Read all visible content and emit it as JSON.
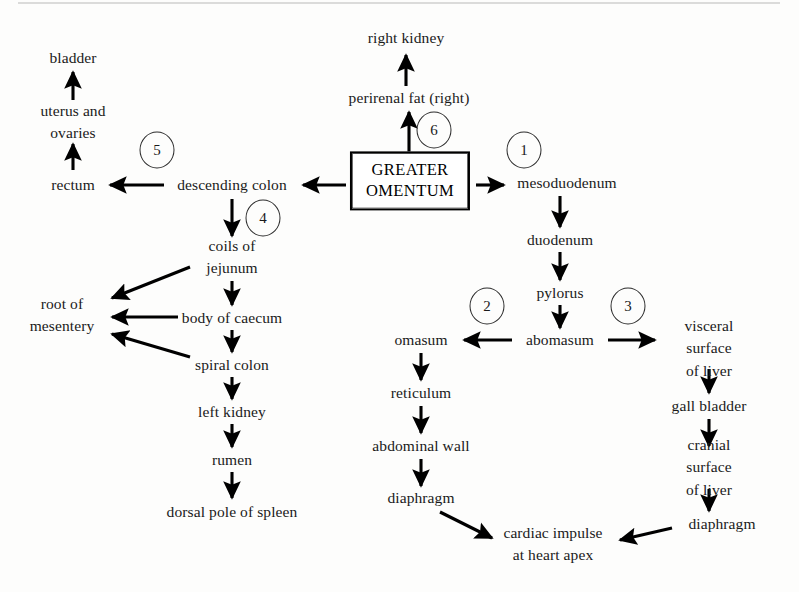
{
  "diagram": {
    "center_box": {
      "label": "GREATER\nOMENTUM",
      "name": "greater-omentum-box"
    },
    "nodes": [
      {
        "id": "bladder",
        "label": "bladder",
        "x": 73,
        "y": 58
      },
      {
        "id": "uterus-ovaries",
        "label": "uterus and\novaries",
        "x": 73,
        "y": 122
      },
      {
        "id": "rectum",
        "label": "rectum",
        "x": 73,
        "y": 185
      },
      {
        "id": "descending-colon",
        "label": "descending colon",
        "x": 232,
        "y": 185
      },
      {
        "id": "coils-of-jejunum",
        "label": "coils of\njejunum",
        "x": 232,
        "y": 257
      },
      {
        "id": "body-of-caecum",
        "label": "body of caecum",
        "x": 232,
        "y": 318
      },
      {
        "id": "spiral-colon",
        "label": "spiral colon",
        "x": 232,
        "y": 365
      },
      {
        "id": "left-kidney",
        "label": "left kidney",
        "x": 232,
        "y": 412
      },
      {
        "id": "rumen",
        "label": "rumen",
        "x": 232,
        "y": 460
      },
      {
        "id": "dorsal-pole-spleen",
        "label": "dorsal pole of spleen",
        "x": 232,
        "y": 512
      },
      {
        "id": "root-of-mesentery",
        "label": "root of\nmesentery",
        "x": 62,
        "y": 315
      },
      {
        "id": "right-kidney",
        "label": "right kidney",
        "x": 406,
        "y": 38
      },
      {
        "id": "perirenal-fat-right",
        "label": "perirenal fat (right)",
        "x": 409,
        "y": 98
      },
      {
        "id": "mesoduodenum",
        "label": "mesoduodenum",
        "x": 567,
        "y": 183
      },
      {
        "id": "duodenum",
        "label": "duodenum",
        "x": 560,
        "y": 240
      },
      {
        "id": "pylorus",
        "label": "pylorus",
        "x": 560,
        "y": 293
      },
      {
        "id": "abomasum",
        "label": "abomasum",
        "x": 560,
        "y": 340
      },
      {
        "id": "omasum",
        "label": "omasum",
        "x": 421,
        "y": 340
      },
      {
        "id": "reticulum",
        "label": "reticulum",
        "x": 421,
        "y": 393
      },
      {
        "id": "abdominal-wall",
        "label": "abdominal wall",
        "x": 421,
        "y": 446
      },
      {
        "id": "diaphragm-left",
        "label": "diaphragm",
        "x": 421,
        "y": 498
      },
      {
        "id": "visceral-surface-liver",
        "label": "visceral surface\nof liver",
        "x": 709,
        "y": 349
      },
      {
        "id": "gall-bladder",
        "label": "gall bladder",
        "x": 709,
        "y": 406
      },
      {
        "id": "cranial-surface-liver",
        "label": "cranial surface\nof liver",
        "x": 709,
        "y": 468
      },
      {
        "id": "diaphragm-right",
        "label": "diaphragm",
        "x": 722,
        "y": 524
      },
      {
        "id": "cardiac-impulse",
        "label": "cardiac impulse\nat heart apex",
        "x": 553,
        "y": 544
      }
    ],
    "circles": [
      {
        "id": "route-5",
        "label": "5",
        "x": 157,
        "y": 150
      },
      {
        "id": "route-4",
        "label": "4",
        "x": 263,
        "y": 218
      },
      {
        "id": "route-6",
        "label": "6",
        "x": 434,
        "y": 130
      },
      {
        "id": "route-1",
        "label": "1",
        "x": 524,
        "y": 150
      },
      {
        "id": "route-2",
        "label": "2",
        "x": 487,
        "y": 306
      },
      {
        "id": "route-3",
        "label": "3",
        "x": 628,
        "y": 306
      }
    ],
    "arrows": [
      {
        "id": "arrow-uterus-to-bladder",
        "from": "uterus and ovaries",
        "to": "bladder",
        "x1": 73,
        "y1": 100,
        "x2": 73,
        "y2": 72
      },
      {
        "id": "arrow-rectum-to-uterus",
        "from": "rectum",
        "to": "uterus and ovaries",
        "x1": 73,
        "y1": 170,
        "x2": 73,
        "y2": 144
      },
      {
        "id": "arrow-descending-colon-to-rectum",
        "from": "descending colon",
        "to": "rectum",
        "x1": 164,
        "y1": 185,
        "x2": 110,
        "y2": 185
      },
      {
        "id": "arrow-omentum-to-descending-colon",
        "from": "GREATER OMENTUM",
        "to": "descending colon",
        "x1": 346,
        "y1": 185,
        "x2": 303,
        "y2": 185
      },
      {
        "id": "arrow-descending-colon-to-jejunum",
        "from": "descending colon",
        "to": "coils of jejunum",
        "x1": 232,
        "y1": 199,
        "x2": 232,
        "y2": 236
      },
      {
        "id": "arrow-jejunum-to-mesentery",
        "from": "coils of jejunum",
        "to": "root of mesentery",
        "x1": 190,
        "y1": 267,
        "x2": 112,
        "y2": 298
      },
      {
        "id": "arrow-jejunum-to-caecum",
        "from": "coils of jejunum",
        "to": "body of caecum",
        "x1": 232,
        "y1": 281,
        "x2": 232,
        "y2": 305
      },
      {
        "id": "arrow-caecum-to-mesentery",
        "from": "body of caecum",
        "to": "root of mesentery",
        "x1": 178,
        "y1": 317,
        "x2": 112,
        "y2": 317
      },
      {
        "id": "arrow-caecum-to-spiral-colon",
        "from": "body of caecum",
        "to": "spiral colon",
        "x1": 232,
        "y1": 330,
        "x2": 232,
        "y2": 352
      },
      {
        "id": "arrow-spiral-colon-to-mesentery",
        "from": "spiral colon",
        "to": "root of mesentery",
        "x1": 190,
        "y1": 357,
        "x2": 112,
        "y2": 334
      },
      {
        "id": "arrow-spiral-colon-to-left-kidney",
        "from": "spiral colon",
        "to": "left kidney",
        "x1": 232,
        "y1": 377,
        "x2": 232,
        "y2": 399
      },
      {
        "id": "arrow-left-kidney-to-rumen",
        "from": "left kidney",
        "to": "rumen",
        "x1": 232,
        "y1": 424,
        "x2": 232,
        "y2": 447
      },
      {
        "id": "arrow-rumen-to-spleen",
        "from": "rumen",
        "to": "dorsal pole of spleen",
        "x1": 232,
        "y1": 472,
        "x2": 232,
        "y2": 498
      },
      {
        "id": "arrow-omentum-to-perirenal-fat",
        "from": "GREATER OMENTUM",
        "to": "perirenal fat (right)",
        "x1": 409,
        "y1": 154,
        "x2": 409,
        "y2": 112
      },
      {
        "id": "arrow-perirenal-fat-to-kidney",
        "from": "perirenal fat (right)",
        "to": "right kidney",
        "x1": 406,
        "y1": 86,
        "x2": 406,
        "y2": 55
      },
      {
        "id": "arrow-omentum-to-mesoduodenum",
        "from": "GREATER OMENTUM",
        "to": "mesoduodenum",
        "x1": 476,
        "y1": 185,
        "x2": 504,
        "y2": 185
      },
      {
        "id": "arrow-mesoduodenum-to-duodenum",
        "from": "mesoduodenum",
        "to": "duodenum",
        "x1": 560,
        "y1": 196,
        "x2": 560,
        "y2": 227
      },
      {
        "id": "arrow-duodenum-to-pylorus",
        "from": "duodenum",
        "to": "pylorus",
        "x1": 560,
        "y1": 252,
        "x2": 560,
        "y2": 280
      },
      {
        "id": "arrow-pylorus-to-abomasum",
        "from": "pylorus",
        "to": "abomasum",
        "x1": 560,
        "y1": 305,
        "x2": 560,
        "y2": 328
      },
      {
        "id": "arrow-abomasum-to-omasum",
        "from": "abomasum",
        "to": "omasum",
        "x1": 512,
        "y1": 340,
        "x2": 464,
        "y2": 340
      },
      {
        "id": "arrow-abomasum-to-visceral-liver",
        "from": "abomasum",
        "to": "visceral surface of liver",
        "x1": 608,
        "y1": 340,
        "x2": 655,
        "y2": 340
      },
      {
        "id": "arrow-omasum-to-reticulum",
        "from": "omasum",
        "to": "reticulum",
        "x1": 421,
        "y1": 353,
        "x2": 421,
        "y2": 380
      },
      {
        "id": "arrow-reticulum-to-abdominal-wall",
        "from": "reticulum",
        "to": "abdominal wall",
        "x1": 421,
        "y1": 406,
        "x2": 421,
        "y2": 433
      },
      {
        "id": "arrow-abdominal-wall-to-diaphragm",
        "from": "abdominal wall",
        "to": "diaphragm",
        "x1": 421,
        "y1": 459,
        "x2": 421,
        "y2": 486
      },
      {
        "id": "arrow-diaphragm-to-cardiac-impulse-left",
        "from": "diaphragm",
        "to": "cardiac impulse at heart apex",
        "x1": 440,
        "y1": 512,
        "x2": 492,
        "y2": 538
      },
      {
        "id": "arrow-visceral-to-gall-bladder",
        "from": "visceral surface of liver",
        "to": "gall bladder",
        "x1": 709,
        "y1": 369,
        "x2": 709,
        "y2": 393
      },
      {
        "id": "arrow-gall-bladder-to-cranial-liver",
        "from": "gall bladder",
        "to": "cranial surface of liver",
        "x1": 709,
        "y1": 419,
        "x2": 709,
        "y2": 446
      },
      {
        "id": "arrow-cranial-liver-to-diaphragm",
        "from": "cranial surface of liver",
        "to": "diaphragm",
        "x1": 709,
        "y1": 489,
        "x2": 709,
        "y2": 511
      },
      {
        "id": "arrow-diaphragm-to-cardiac-impulse-right",
        "from": "diaphragm",
        "to": "cardiac impulse at heart apex",
        "x1": 672,
        "y1": 528,
        "x2": 620,
        "y2": 540
      }
    ]
  }
}
